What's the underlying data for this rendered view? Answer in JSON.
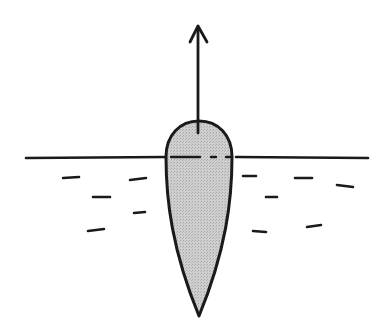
{
  "diagram": {
    "colors": {
      "stroke": "#1a1a1a",
      "body_fill": "#c8c8c8",
      "background": "#ffffff"
    },
    "waterline_y": 157,
    "arrow": {
      "x": 198,
      "y_tip": 25,
      "y_base": 132,
      "direction": "up"
    },
    "body": {
      "top_y": 120,
      "left_x": 166,
      "right_x": 232,
      "tip_x": 199,
      "tip_y": 316
    },
    "water_dashes": [
      [
        63,
        178,
        79,
        177
      ],
      [
        130,
        180,
        146,
        178
      ],
      [
        93,
        197,
        110,
        197
      ],
      [
        134,
        213,
        145,
        212
      ],
      [
        88,
        231,
        104,
        229
      ],
      [
        243,
        176,
        256,
        176
      ],
      [
        295,
        178,
        312,
        178
      ],
      [
        337,
        185,
        353,
        187
      ],
      [
        266,
        197,
        277,
        197
      ],
      [
        253,
        231,
        266,
        232
      ],
      [
        307,
        227,
        321,
        225
      ]
    ]
  }
}
